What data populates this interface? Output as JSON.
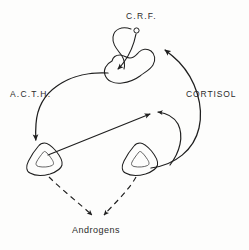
{
  "diagram": {
    "background_color": "#fdfdfc",
    "ink_color": "#1f1f1f",
    "labels": {
      "crf": "C.R.F.",
      "acth": "A.C.T.H.",
      "cortisol": "CORTISOL",
      "androgens": "Androgens"
    },
    "nodes": [
      {
        "id": "neuron-soma",
        "name": "CRF neuron cell body",
        "shape": "small-circle"
      },
      {
        "id": "pituitary",
        "name": "Pituitary gland",
        "shape": "blob"
      },
      {
        "id": "adrenal-left",
        "name": "Left adrenal gland",
        "shape": "triangle"
      },
      {
        "id": "adrenal-right",
        "name": "Right adrenal gland",
        "shape": "triangle"
      }
    ],
    "connections": [
      {
        "id": "crf-to-pituitary",
        "from": "neuron-soma",
        "to": "pituitary",
        "style": "solid",
        "arrow": true
      },
      {
        "id": "acth-to-adrenal",
        "from": "pituitary",
        "to": "adrenal-left",
        "style": "solid",
        "arrow": true,
        "label": "A.C.T.H."
      },
      {
        "id": "cortisol-to-hypothalamus",
        "from": "adrenal-right",
        "to": "pituitary",
        "style": "solid",
        "arrow": true,
        "label": "CORTISOL"
      },
      {
        "id": "cortisol-feedback-inner",
        "from": "adrenal-right",
        "to": "midpoint",
        "style": "solid",
        "arrow": true
      },
      {
        "id": "adrenal-to-midpoint",
        "from": "adrenal-left",
        "to": "midpoint",
        "style": "solid",
        "arrow": true
      },
      {
        "id": "androgens-left",
        "from": "adrenal-left",
        "to": "androgens",
        "style": "dashed",
        "arrow": true
      },
      {
        "id": "androgens-right",
        "from": "adrenal-right",
        "to": "androgens",
        "style": "dashed",
        "arrow": true
      }
    ]
  }
}
